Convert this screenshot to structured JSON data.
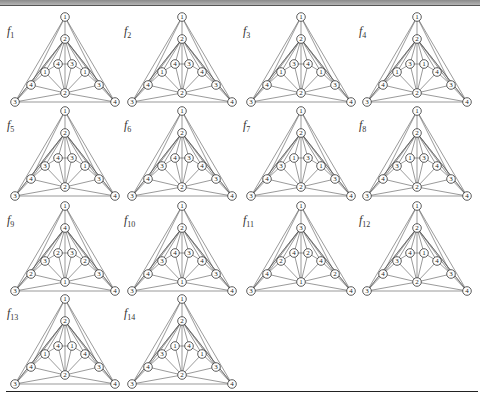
{
  "figure": {
    "node_order": [
      "top",
      "upper",
      "inner_left",
      "inner_right",
      "mid_left",
      "mid_right",
      "outer_left",
      "outer_right",
      "center",
      "bottom_left",
      "bottom_right"
    ],
    "panels": [
      {
        "name": "f",
        "sub": "1",
        "labels": [
          "1",
          "2",
          "4",
          "3",
          "1",
          "1",
          "4",
          "3",
          "2",
          "3",
          "4"
        ]
      },
      {
        "name": "f",
        "sub": "2",
        "labels": [
          "1",
          "2",
          "4",
          "3",
          "1",
          "4",
          "4",
          "3",
          "2",
          "3",
          "4"
        ]
      },
      {
        "name": "f",
        "sub": "3",
        "labels": [
          "1",
          "2",
          "3",
          "4",
          "1",
          "1",
          "4",
          "3",
          "2",
          "3",
          "4"
        ]
      },
      {
        "name": "f",
        "sub": "4",
        "labels": [
          "1",
          "2",
          "3",
          "1",
          "1",
          "4",
          "4",
          "3",
          "2",
          "3",
          "4"
        ]
      },
      {
        "name": "f",
        "sub": "5",
        "labels": [
          "1",
          "2",
          "4",
          "3",
          "3",
          "1",
          "4",
          "3",
          "2",
          "3",
          "4"
        ]
      },
      {
        "name": "f",
        "sub": "6",
        "labels": [
          "1",
          "2",
          "4",
          "3",
          "3",
          "4",
          "4",
          "3",
          "2",
          "3",
          "4"
        ]
      },
      {
        "name": "f",
        "sub": "7",
        "labels": [
          "1",
          "2",
          "1",
          "3",
          "3",
          "1",
          "4",
          "3",
          "2",
          "3",
          "4"
        ]
      },
      {
        "name": "f",
        "sub": "8",
        "labels": [
          "1",
          "2",
          "1",
          "3",
          "3",
          "4",
          "4",
          "3",
          "2",
          "3",
          "4"
        ]
      },
      {
        "name": "f",
        "sub": "9",
        "labels": [
          "1",
          "4",
          "2",
          "3",
          "3",
          "2",
          "2",
          "3",
          "1",
          "3",
          "4"
        ]
      },
      {
        "name": "f",
        "sub": "10",
        "labels": [
          "1",
          "2",
          "4",
          "3",
          "3",
          "4",
          "4",
          "3",
          "1",
          "3",
          "4"
        ]
      },
      {
        "name": "f",
        "sub": "11",
        "labels": [
          "1",
          "3",
          "4",
          "2",
          "2",
          "4",
          "4",
          "2",
          "1",
          "3",
          "4"
        ]
      },
      {
        "name": "f",
        "sub": "12",
        "labels": [
          "1",
          "2",
          "4",
          "1",
          "3",
          "4",
          "4",
          "3",
          "2",
          "3",
          "4"
        ]
      },
      {
        "name": "f",
        "sub": "13",
        "labels": [
          "1",
          "2",
          "4",
          "1",
          "1",
          "4",
          "4",
          "3",
          "2",
          "3",
          "4"
        ]
      },
      {
        "name": "f",
        "sub": "14",
        "labels": [
          "1",
          "2",
          "1",
          "4",
          "3",
          "1",
          "4",
          "3",
          "2",
          "3",
          "4"
        ]
      }
    ]
  },
  "colors": {
    "edge": "#555555",
    "node_stroke": "#333333",
    "node_fill": "#ffffff",
    "text": "#222222",
    "header_bar": "#9a9a9a"
  }
}
